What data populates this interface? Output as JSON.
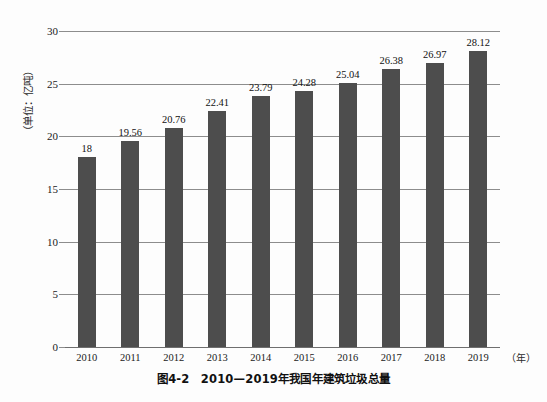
{
  "figure": {
    "caption": "图4-2　2010—2019年我国年建筑垃圾总量",
    "y_axis_title": "（单位：亿吨）",
    "x_axis_unit": "（年）"
  },
  "chart_data": {
    "type": "bar",
    "title": "图4-2　2010—2019年我国年建筑垃圾总量",
    "xlabel": "（年）",
    "ylabel": "（单位：亿吨）",
    "categories": [
      "2010",
      "2011",
      "2012",
      "2013",
      "2014",
      "2015",
      "2016",
      "2017",
      "2018",
      "2019"
    ],
    "values": [
      18,
      19.56,
      20.76,
      22.41,
      23.79,
      24.28,
      25.04,
      26.38,
      26.97,
      28.12
    ],
    "value_labels": [
      "18",
      "19.56",
      "20.76",
      "22.41",
      "23.79",
      "24.28",
      "25.04",
      "26.38",
      "26.97",
      "28.12"
    ],
    "ylim": [
      0,
      30
    ],
    "yticks": [
      0,
      5,
      10,
      15,
      20,
      25,
      30
    ],
    "ytick_labels": [
      "0",
      "5",
      "10",
      "15",
      "20",
      "25",
      "30"
    ],
    "grid": true,
    "legend": null,
    "bar_color": "#4d4d4d",
    "gridline_color": "#8d8d8d",
    "background_color": "#fdfdfd"
  }
}
